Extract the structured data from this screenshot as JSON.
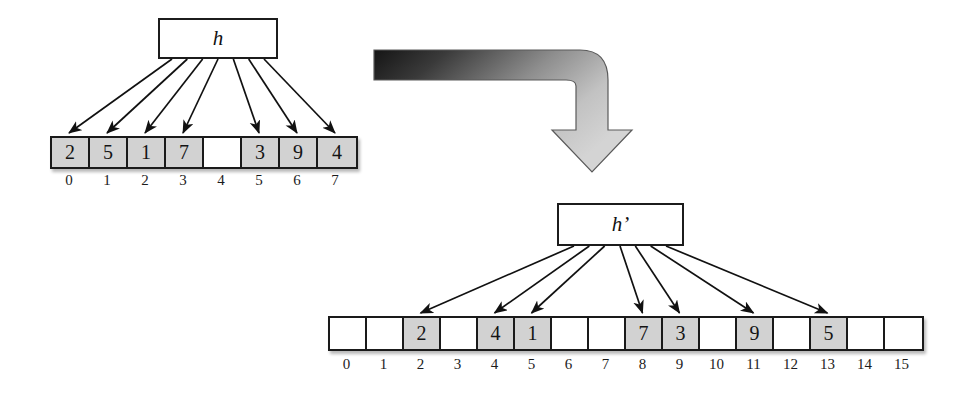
{
  "diagram": {
    "type": "hash-table-rehash",
    "background_color": "#ffffff",
    "ink_color": "#1a1a1a",
    "filled_cell_color": "#d2d2d2",
    "empty_cell_color": "#ffffff"
  },
  "before": {
    "hash_label": "h",
    "table_size": 8,
    "cells": [
      {
        "index": "0",
        "value": "2",
        "filled": true
      },
      {
        "index": "1",
        "value": "5",
        "filled": true
      },
      {
        "index": "2",
        "value": "1",
        "filled": true
      },
      {
        "index": "3",
        "value": "7",
        "filled": true
      },
      {
        "index": "4",
        "value": "",
        "filled": false
      },
      {
        "index": "5",
        "value": "3",
        "filled": true
      },
      {
        "index": "6",
        "value": "9",
        "filled": true
      },
      {
        "index": "7",
        "value": "4",
        "filled": true
      }
    ],
    "mapped_indices": [
      0,
      1,
      2,
      3,
      5,
      6,
      7
    ]
  },
  "after": {
    "hash_label": "h’",
    "table_size": 16,
    "cells": [
      {
        "index": "0",
        "value": "",
        "filled": false
      },
      {
        "index": "1",
        "value": "",
        "filled": false
      },
      {
        "index": "2",
        "value": "2",
        "filled": true
      },
      {
        "index": "3",
        "value": "",
        "filled": false
      },
      {
        "index": "4",
        "value": "4",
        "filled": true
      },
      {
        "index": "5",
        "value": "1",
        "filled": true
      },
      {
        "index": "6",
        "value": "",
        "filled": false
      },
      {
        "index": "7",
        "value": "",
        "filled": false
      },
      {
        "index": "8",
        "value": "7",
        "filled": true
      },
      {
        "index": "9",
        "value": "3",
        "filled": true
      },
      {
        "index": "10",
        "value": "",
        "filled": false
      },
      {
        "index": "11",
        "value": "9",
        "filled": true
      },
      {
        "index": "12",
        "value": "",
        "filled": false
      },
      {
        "index": "13",
        "value": "5",
        "filled": true
      },
      {
        "index": "14",
        "value": "",
        "filled": false
      },
      {
        "index": "15",
        "value": "",
        "filled": false
      }
    ],
    "mapped_indices": [
      2,
      4,
      5,
      8,
      9,
      11,
      13
    ]
  },
  "transition": {
    "icon": "elbow-arrow-down-right",
    "gradient_from": "#1d1d1d",
    "gradient_to": "#cfcfcf"
  }
}
